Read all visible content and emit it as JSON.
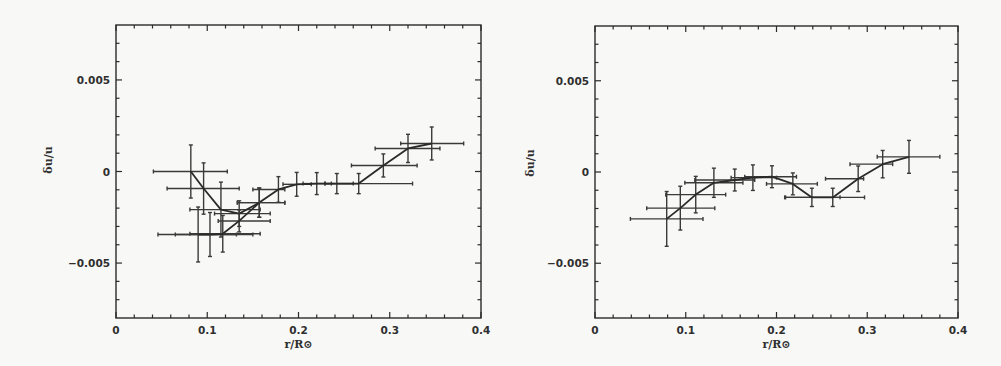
{
  "chart_data": [
    {
      "type": "line",
      "panel": "left",
      "title": "",
      "xlabel": "r/R⊙",
      "ylabel": "δu/u",
      "xlim": [
        0,
        0.4
      ],
      "ylim": [
        -0.008,
        0.008
      ],
      "x_ticks": [
        "0",
        "0.1",
        "0.2",
        "0.3",
        "0.4"
      ],
      "x_tick_values": [
        0,
        0.1,
        0.2,
        0.3,
        0.4
      ],
      "y_ticks": [
        "-0.005",
        "0",
        "0.005"
      ],
      "y_tick_values": [
        -0.005,
        0,
        0.005
      ],
      "x_minor_step": 0.02,
      "y_minor_step": 0.001,
      "grid": false,
      "legend": null,
      "series": [
        {
          "name": "upper branch",
          "points": [
            {
              "x": 0.082,
              "y": 0.0,
              "yerr": 0.00145,
              "xmin": 0.041,
              "xmax": 0.122
            },
            {
              "x": 0.096,
              "y": -0.00093,
              "yerr": 0.0014,
              "xmin": 0.056,
              "xmax": 0.135
            },
            {
              "x": 0.115,
              "y": -0.00208,
              "yerr": 0.0015,
              "xmin": 0.081,
              "xmax": 0.158
            },
            {
              "x": 0.135,
              "y": -0.0023,
              "yerr": 0.0007,
              "xmin": 0.108,
              "xmax": 0.169
            },
            {
              "x": 0.157,
              "y": -0.0017,
              "yerr": 0.0008,
              "xmin": 0.133,
              "xmax": 0.185
            },
            {
              "x": 0.178,
              "y": -0.00098,
              "yerr": 0.0007,
              "xmin": 0.15,
              "xmax": 0.185
            },
            {
              "x": 0.198,
              "y": -0.0007,
              "yerr": 0.00065,
              "xmin": 0.183,
              "xmax": 0.214
            },
            {
              "x": 0.22,
              "y": -0.00066,
              "yerr": 0.0006,
              "xmin": 0.205,
              "xmax": 0.236
            },
            {
              "x": 0.242,
              "y": -0.00066,
              "yerr": 0.00055,
              "xmin": 0.229,
              "xmax": 0.26
            },
            {
              "x": 0.266,
              "y": -0.00066,
              "yerr": 0.00055,
              "xmin": 0.229,
              "xmax": 0.325
            },
            {
              "x": 0.293,
              "y": 0.00033,
              "yerr": 0.00063,
              "xmin": 0.258,
              "xmax": 0.33
            },
            {
              "x": 0.32,
              "y": 0.00126,
              "yerr": 0.00077,
              "xmin": 0.284,
              "xmax": 0.355
            },
            {
              "x": 0.346,
              "y": 0.00153,
              "yerr": 0.0009,
              "xmin": 0.312,
              "xmax": 0.381
            }
          ]
        },
        {
          "name": "lower branch",
          "points": [
            {
              "x": 0.09,
              "y": -0.00344,
              "yerr": 0.0015,
              "xmin": 0.046,
              "xmax": 0.132
            },
            {
              "x": 0.103,
              "y": -0.00344,
              "yerr": 0.0012,
              "xmin": 0.065,
              "xmax": 0.15
            },
            {
              "x": 0.117,
              "y": -0.0034,
              "yerr": 0.001,
              "xmin": 0.081,
              "xmax": 0.158
            },
            {
              "x": 0.135,
              "y": -0.0027,
              "yerr": 0.0006,
              "xmin": 0.112,
              "xmax": 0.169
            },
            {
              "x": 0.157,
              "y": -0.0017,
              "yerr": 0.0008,
              "xmin": 0.133,
              "xmax": 0.185
            }
          ]
        }
      ]
    },
    {
      "type": "line",
      "panel": "right",
      "title": "",
      "xlabel": "r/R⊙",
      "ylabel": "δu/u",
      "xlim": [
        0,
        0.4
      ],
      "ylim": [
        -0.008,
        0.008
      ],
      "x_ticks": [
        "0",
        "0.1",
        "0.2",
        "0.3",
        "0.4"
      ],
      "x_tick_values": [
        0,
        0.1,
        0.2,
        0.3,
        0.4
      ],
      "y_ticks": [
        "-0.005",
        "0",
        "0.005"
      ],
      "y_tick_values": [
        -0.005,
        0,
        0.005
      ],
      "x_minor_step": 0.02,
      "y_minor_step": 0.001,
      "grid": false,
      "legend": null,
      "series": [
        {
          "name": "inversion",
          "points": [
            {
              "x": 0.079,
              "y": -0.00257,
              "yerr": 0.0015,
              "xmin": 0.039,
              "xmax": 0.119
            },
            {
              "x": 0.094,
              "y": -0.00198,
              "yerr": 0.0012,
              "xmin": 0.057,
              "xmax": 0.132
            },
            {
              "x": 0.111,
              "y": -0.00124,
              "yerr": 0.001,
              "xmin": 0.078,
              "xmax": 0.144
            },
            {
              "x": 0.131,
              "y": -0.00059,
              "yerr": 0.0008,
              "xmin": 0.099,
              "xmax": 0.163
            },
            {
              "x": 0.154,
              "y": -0.00044,
              "yerr": 0.0006,
              "xmin": 0.11,
              "xmax": 0.176
            },
            {
              "x": 0.174,
              "y": -0.00031,
              "yerr": 0.0007,
              "xmin": 0.15,
              "xmax": 0.2
            },
            {
              "x": 0.195,
              "y": -0.00026,
              "yerr": 0.0006,
              "xmin": 0.165,
              "xmax": 0.222
            },
            {
              "x": 0.218,
              "y": -0.00065,
              "yerr": 0.0006,
              "xmin": 0.189,
              "xmax": 0.245
            },
            {
              "x": 0.239,
              "y": -0.00139,
              "yerr": 0.0005,
              "xmin": 0.21,
              "xmax": 0.27
            },
            {
              "x": 0.262,
              "y": -0.00139,
              "yerr": 0.0005,
              "xmin": 0.209,
              "xmax": 0.297
            },
            {
              "x": 0.29,
              "y": -0.00037,
              "yerr": 0.0007,
              "xmin": 0.254,
              "xmax": 0.296
            },
            {
              "x": 0.317,
              "y": 0.00043,
              "yerr": 0.00075,
              "xmin": 0.281,
              "xmax": 0.328
            },
            {
              "x": 0.346,
              "y": 0.00083,
              "yerr": 0.0009,
              "xmin": 0.311,
              "xmax": 0.38
            }
          ]
        }
      ]
    }
  ],
  "layout": {
    "panels": [
      {
        "left": 116,
        "top": 25,
        "right": 481,
        "bottom": 318,
        "ylabel_x": 52,
        "ylabel_y": 160
      },
      {
        "left": 595,
        "top": 26,
        "right": 958,
        "bottom": 318,
        "ylabel_x": 534,
        "ylabel_y": 163
      }
    ],
    "colors": {
      "ink": "#2b2b2b",
      "background": "#f8f8f6"
    }
  }
}
